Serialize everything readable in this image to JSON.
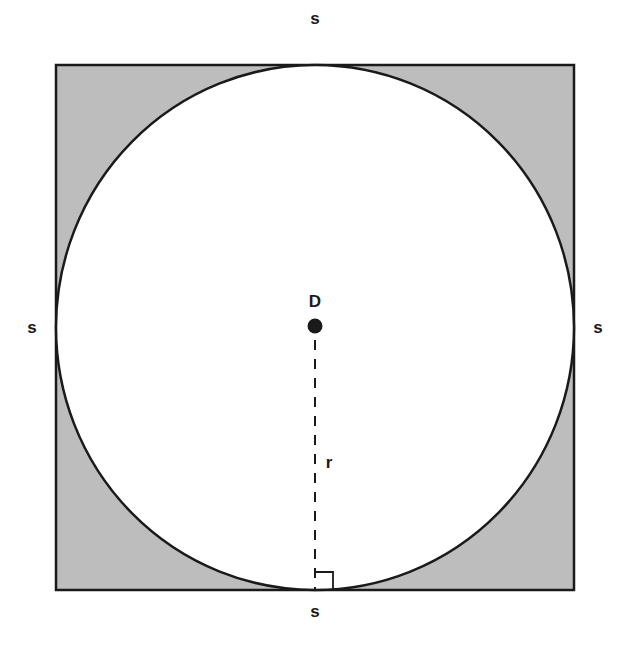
{
  "diagram": {
    "title": "",
    "colors": {
      "background": "#ffffff",
      "square_fill": "#bdbdbd",
      "circle_fill": "#ffffff",
      "stroke": "#1a1a1a"
    },
    "square": {
      "side_labels": {
        "top": "s",
        "bottom": "s",
        "left": "s",
        "right": "s"
      }
    },
    "circle": {
      "center_label": "D",
      "radius_label": "r"
    },
    "annotations": {
      "right_angle_marker": "right angle at point of tangency on bottom side",
      "radius_style": "dashed"
    }
  }
}
